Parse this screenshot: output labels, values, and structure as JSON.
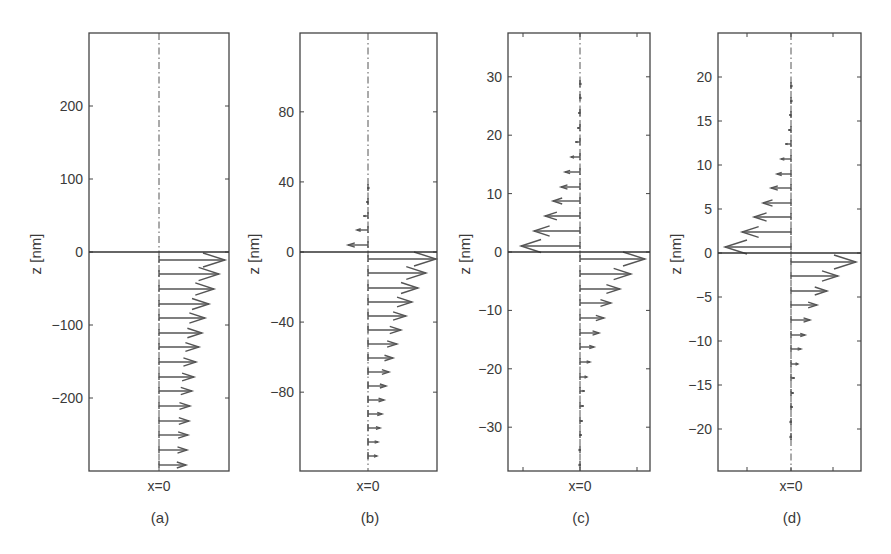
{
  "figure": {
    "panels": [
      {
        "id": "a",
        "caption": "(a)",
        "xlabel": "x=0",
        "ylabel": "z [nm]"
      },
      {
        "id": "b",
        "caption": "(b)",
        "xlabel": "x=0",
        "ylabel": "z [nm]"
      },
      {
        "id": "c",
        "caption": "(c)",
        "xlabel": "x=0",
        "ylabel": "z [nm]"
      },
      {
        "id": "d",
        "caption": "(d)",
        "xlabel": "x=0",
        "ylabel": "z [nm]"
      }
    ]
  },
  "chart_data": [
    {
      "type": "quiver",
      "panel": "(a)",
      "title": "",
      "xlabel": "x=0",
      "ylabel": "z [nm]",
      "ylim": [
        -300,
        300
      ],
      "yticks": [
        -200,
        -100,
        0,
        100,
        200
      ],
      "grid": false,
      "frame": {
        "left": 89,
        "right": 229,
        "top": 33,
        "bottom": 471,
        "zero_y": 252,
        "center_x": 159
      },
      "xticks_px": [],
      "arrows_px": {
        "above": [],
        "below_y": [
          260,
          274,
          289,
          304,
          318,
          333,
          347,
          362,
          377,
          391,
          406,
          421,
          435,
          450,
          465
        ],
        "below_len": [
          66,
          60,
          55,
          50,
          46,
          43,
          40,
          37,
          35,
          33,
          31,
          30,
          29,
          28,
          27
        ]
      },
      "arrows": [
        {
          "z": -10,
          "u": 1.0
        },
        {
          "z": -30,
          "u": 0.91
        },
        {
          "z": -50,
          "u": 0.83
        },
        {
          "z": -70,
          "u": 0.76
        },
        {
          "z": -90,
          "u": 0.7
        },
        {
          "z": -110,
          "u": 0.65
        },
        {
          "z": -130,
          "u": 0.61
        },
        {
          "z": -150,
          "u": 0.56
        },
        {
          "z": -170,
          "u": 0.53
        },
        {
          "z": -190,
          "u": 0.5
        },
        {
          "z": -210,
          "u": 0.47
        },
        {
          "z": -230,
          "u": 0.45
        },
        {
          "z": -250,
          "u": 0.44
        },
        {
          "z": -270,
          "u": 0.42
        },
        {
          "z": -290,
          "u": 0.41
        }
      ]
    },
    {
      "type": "quiver",
      "panel": "(b)",
      "title": "",
      "xlabel": "x=0",
      "ylabel": "z [nm]",
      "ylim": [
        -125,
        125
      ],
      "yticks": [
        -80,
        -40,
        0,
        40,
        80
      ],
      "grid": false,
      "frame": {
        "left": 300,
        "right": 437,
        "top": 33,
        "bottom": 471,
        "zero_y": 252,
        "center_x": 368
      },
      "xticks_px": [],
      "arrows_px": {
        "above_y": [
          245,
          230,
          216,
          202,
          188
        ],
        "above_len": [
          20,
          11,
          5,
          2,
          1
        ],
        "below_y": [
          259,
          273,
          288,
          302,
          316,
          330,
          344,
          358,
          372,
          386,
          400,
          414,
          428,
          442,
          456
        ],
        "below_len": [
          68,
          58,
          50,
          44,
          38,
          33,
          29,
          25,
          21,
          18,
          16,
          14,
          12,
          10,
          9
        ]
      },
      "arrows": [
        {
          "z": 4,
          "u": -0.29
        },
        {
          "z": 12,
          "u": -0.16
        },
        {
          "z": 20,
          "u": -0.07
        },
        {
          "z": 28,
          "u": -0.03
        },
        {
          "z": 36,
          "u": -0.01
        },
        {
          "z": -4,
          "u": 1.0
        },
        {
          "z": -12,
          "u": 0.85
        },
        {
          "z": -20,
          "u": 0.74
        },
        {
          "z": -28,
          "u": 0.65
        },
        {
          "z": -36,
          "u": 0.56
        },
        {
          "z": -44,
          "u": 0.49
        },
        {
          "z": -52,
          "u": 0.43
        },
        {
          "z": -60,
          "u": 0.37
        },
        {
          "z": -68,
          "u": 0.31
        },
        {
          "z": -76,
          "u": 0.26
        },
        {
          "z": -84,
          "u": 0.24
        },
        {
          "z": -92,
          "u": 0.21
        },
        {
          "z": -100,
          "u": 0.18
        },
        {
          "z": -108,
          "u": 0.15
        },
        {
          "z": -116,
          "u": 0.13
        }
      ]
    },
    {
      "type": "quiver",
      "panel": "(c)",
      "title": "",
      "xlabel": "x=0",
      "ylabel": "z [nm]",
      "ylim": [
        -37.5,
        37.5
      ],
      "yticks": [
        -30,
        -20,
        -10,
        0,
        10,
        20,
        30
      ],
      "grid": false,
      "frame": {
        "left": 508,
        "right": 650,
        "top": 33,
        "bottom": 471,
        "zero_y": 252,
        "center_x": 580
      },
      "xticks_px": [
        523,
        580,
        637
      ],
      "arrows_px": {
        "above_y": [
          246,
          231,
          216,
          201,
          187,
          172,
          157,
          142,
          128,
          113,
          98,
          84
        ],
        "above_len": [
          59,
          46,
          35,
          27,
          19,
          15,
          9,
          5,
          3,
          2,
          1,
          1
        ],
        "below_y": [
          259,
          274,
          289,
          303,
          318,
          333,
          347,
          362,
          377,
          391,
          406,
          421,
          435,
          450,
          465
        ],
        "below_len": [
          65,
          51,
          40,
          31,
          24,
          19,
          14,
          10,
          7,
          5,
          4,
          3,
          2,
          1,
          1
        ]
      },
      "arrows": [
        {
          "z": 1.2,
          "u": -0.91
        },
        {
          "z": 3.7,
          "u": -0.71
        },
        {
          "z": 6.2,
          "u": -0.54
        },
        {
          "z": 8.7,
          "u": -0.42
        },
        {
          "z": 11.2,
          "u": -0.29
        },
        {
          "z": 13.7,
          "u": -0.23
        },
        {
          "z": 16.2,
          "u": -0.14
        },
        {
          "z": 18.7,
          "u": -0.08
        },
        {
          "z": -1.2,
          "u": 1.0
        },
        {
          "z": -3.7,
          "u": 0.78
        },
        {
          "z": -6.2,
          "u": 0.62
        },
        {
          "z": -8.7,
          "u": 0.48
        },
        {
          "z": -11.2,
          "u": 0.37
        },
        {
          "z": -13.7,
          "u": 0.29
        },
        {
          "z": -16.2,
          "u": 0.22
        },
        {
          "z": -18.7,
          "u": 0.15
        },
        {
          "z": -21.2,
          "u": 0.11
        },
        {
          "z": -23.7,
          "u": 0.08
        }
      ]
    },
    {
      "type": "quiver",
      "panel": "(d)",
      "title": "",
      "xlabel": "x=0",
      "ylabel": "z [nm]",
      "ylim": [
        -25,
        25
      ],
      "yticks": [
        -20,
        -15,
        -10,
        -5,
        0,
        5,
        10,
        15,
        20
      ],
      "grid": false,
      "frame": {
        "left": 718,
        "right": 861,
        "top": 33,
        "bottom": 471,
        "zero_y": 253,
        "center_x": 791
      },
      "xticks_px": [
        747,
        791,
        833
      ],
      "arrows_px": {
        "above_y": [
          247,
          232,
          217,
          203,
          188,
          174,
          159,
          144,
          130,
          115,
          101,
          86
        ],
        "above_len": [
          66,
          49,
          37,
          28,
          20,
          14,
          10,
          6,
          3,
          2,
          1,
          1
        ],
        "below_y": [
          262,
          276,
          291,
          305,
          320,
          335,
          349,
          364,
          378,
          393,
          407,
          422,
          437
        ],
        "below_len": [
          65,
          47,
          36,
          26,
          19,
          14,
          10,
          7,
          4,
          3,
          2,
          1,
          1
        ]
      },
      "arrows": [
        {
          "z": 0.8,
          "u": -1.0
        },
        {
          "z": 2.5,
          "u": -0.74
        },
        {
          "z": 4.1,
          "u": -0.56
        },
        {
          "z": 5.8,
          "u": -0.42
        },
        {
          "z": 7.4,
          "u": -0.3
        },
        {
          "z": 9.1,
          "u": -0.21
        },
        {
          "z": 10.7,
          "u": -0.15
        },
        {
          "z": 12.4,
          "u": -0.09
        },
        {
          "z": -0.8,
          "u": 0.98
        },
        {
          "z": -2.5,
          "u": 0.71
        },
        {
          "z": -4.1,
          "u": 0.55
        },
        {
          "z": -5.8,
          "u": 0.39
        },
        {
          "z": -7.4,
          "u": 0.29
        },
        {
          "z": -9.1,
          "u": 0.21
        },
        {
          "z": -10.7,
          "u": 0.15
        },
        {
          "z": -12.4,
          "u": 0.11
        }
      ]
    }
  ]
}
